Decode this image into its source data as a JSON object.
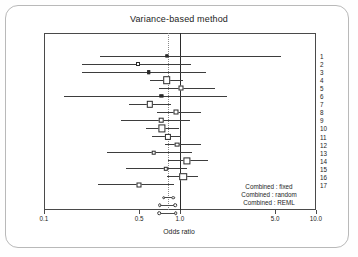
{
  "chart_data": {
    "type": "forest",
    "title": "Variance-based method",
    "xlabel": "Odds ratio",
    "ylabel": "Citation",
    "xscale": "log",
    "xlim": [
      0.1,
      10.0
    ],
    "xticks": [
      "0.1",
      "0.5",
      "1.0",
      "5.0",
      "10.0"
    ],
    "xtick_values": [
      0.1,
      0.5,
      1.0,
      5.0,
      10.0
    ],
    "grid": false,
    "reference_line": 1.0,
    "pooled_reference_line": 0.82,
    "categories": [
      "1",
      "2",
      "3",
      "4",
      "5",
      "6",
      "7",
      "8",
      "9",
      "10",
      "11",
      "12",
      "13",
      "14",
      "15",
      "16",
      "17"
    ],
    "studies": [
      {
        "label": "1",
        "or": 0.8,
        "low": 0.26,
        "high": 5.5,
        "size": 1.2
      },
      {
        "label": "2",
        "or": 0.49,
        "low": 0.19,
        "high": 1.2,
        "size": 2.0
      },
      {
        "label": "3",
        "or": 0.59,
        "low": 0.19,
        "high": 1.55,
        "size": 1.6
      },
      {
        "label": "4",
        "or": 0.8,
        "low": 0.6,
        "high": 1.05,
        "size": 5.6
      },
      {
        "label": "5",
        "or": 1.02,
        "low": 0.7,
        "high": 1.8,
        "size": 3.0
      },
      {
        "label": "6",
        "or": 0.73,
        "low": 0.14,
        "high": 2.2,
        "size": 1.2
      },
      {
        "label": "7",
        "or": 0.6,
        "low": 0.42,
        "high": 0.86,
        "size": 4.4
      },
      {
        "label": "8",
        "or": 0.93,
        "low": 0.68,
        "high": 1.42,
        "size": 3.0
      },
      {
        "label": "9",
        "or": 0.73,
        "low": 0.37,
        "high": 1.18,
        "size": 2.6
      },
      {
        "label": "10",
        "or": 0.74,
        "low": 0.56,
        "high": 0.99,
        "size": 5.2
      },
      {
        "label": "11",
        "or": 0.82,
        "low": 0.62,
        "high": 1.02,
        "size": 4.2
      },
      {
        "label": "12",
        "or": 0.95,
        "low": 0.78,
        "high": 1.42,
        "size": 2.8
      },
      {
        "label": "13",
        "or": 0.64,
        "low": 0.29,
        "high": 1.22,
        "size": 2.6
      },
      {
        "label": "14",
        "or": 1.13,
        "low": 0.82,
        "high": 1.6,
        "size": 5.2
      },
      {
        "label": "15",
        "or": 0.79,
        "low": 0.4,
        "high": 1.12,
        "size": 2.4
      },
      {
        "label": "16",
        "or": 1.06,
        "low": 0.8,
        "high": 1.35,
        "size": 5.6
      },
      {
        "label": "17",
        "or": 0.5,
        "low": 0.25,
        "high": 0.91,
        "size": 3.0
      }
    ],
    "pooled": [
      {
        "label": "Combined : fixed",
        "or": 0.82,
        "low": 0.76,
        "high": 0.89
      },
      {
        "label": "Combined : random",
        "or": 0.8,
        "low": 0.71,
        "high": 0.92
      },
      {
        "label": "Combined : REML",
        "or": 0.8,
        "low": 0.7,
        "high": 0.93
      }
    ]
  },
  "legend": {
    "items": [
      {
        "label": "Combined : fixed"
      },
      {
        "label": "Combined : random"
      },
      {
        "label": "Combined : REML"
      }
    ]
  },
  "colors": {
    "frame": "#4a4a4a",
    "line": "#3d3d3d",
    "reference": "#2b2b2b",
    "pooled_reference": "#8a8a8a",
    "text": "#1c1c1c",
    "background": "#ffffff"
  }
}
